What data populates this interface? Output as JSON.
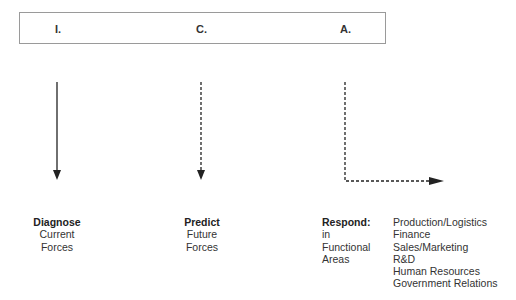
{
  "header": {
    "items": [
      "I.",
      "C.",
      "A."
    ]
  },
  "columns": [
    {
      "title": "Diagnose",
      "lines": [
        "Current",
        "Forces"
      ],
      "arrow": "solid"
    },
    {
      "title": "Predict",
      "lines": [
        "Future",
        "Forces"
      ],
      "arrow": "dashed"
    },
    {
      "title": "Respond:",
      "lines": [
        "in",
        "Functional",
        "Areas"
      ],
      "arrow": "dashed-elbow"
    }
  ],
  "functional_areas": [
    "Production/Logistics",
    "Finance",
    "Sales/Marketing",
    "R&D",
    "Human Resources",
    "Government Relations"
  ],
  "colors": {
    "line": "#222222",
    "box_border": "#9a9a9a"
  }
}
